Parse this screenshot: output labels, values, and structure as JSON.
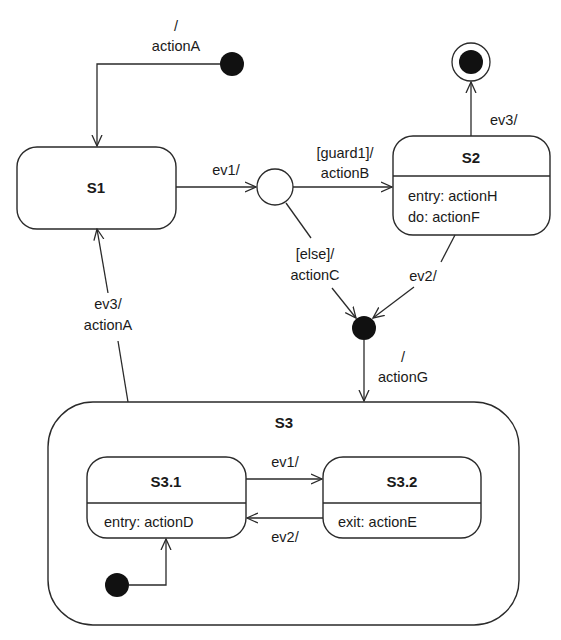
{
  "diagram": {
    "type": "uml-state-machine",
    "states": {
      "s1": {
        "name": "S1"
      },
      "s2": {
        "name": "S2",
        "entry": "entry: actionH",
        "do": "do: actionF"
      },
      "s3": {
        "name": "S3"
      },
      "s31": {
        "name": "S3.1",
        "entry": "entry: actionD"
      },
      "s32": {
        "name": "S3.2",
        "exit": "exit: actionE"
      }
    },
    "transitions": {
      "init_s1": {
        "line1": "/",
        "line2": "actionA"
      },
      "s1_choice": {
        "label": "ev1/"
      },
      "choice_s2": {
        "line1": "[guard1]/",
        "line2": "actionB"
      },
      "choice_merge": {
        "line1": "[else]/",
        "line2": "actionC"
      },
      "s2_final": {
        "label": "ev3/"
      },
      "s2_merge": {
        "label": "ev2/"
      },
      "merge_s3": {
        "line1": "/",
        "line2": "actionG"
      },
      "s3_s1": {
        "line1": "ev3/",
        "line2": "actionA"
      },
      "s31_s32": {
        "label": "ev1/"
      },
      "s32_s31": {
        "label": "ev2/"
      }
    }
  }
}
